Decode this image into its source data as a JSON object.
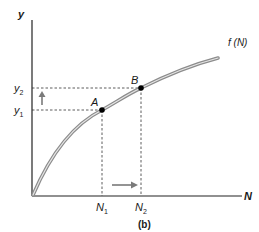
{
  "diagram": {
    "caption": "(b)",
    "axes": {
      "y_label": "y",
      "x_label": "N"
    },
    "curve": {
      "label": "f (N)",
      "color": "#9a9a9a"
    },
    "points": [
      {
        "name": "A",
        "label": "A"
      },
      {
        "name": "B",
        "label": "B"
      }
    ],
    "y_ticks": [
      {
        "base": "y",
        "sub": "2"
      },
      {
        "base": "y",
        "sub": "1"
      }
    ],
    "x_ticks": [
      {
        "base": "N",
        "sub": "1"
      },
      {
        "base": "N",
        "sub": "2"
      }
    ],
    "arrows": {
      "vertical": "up-arrow",
      "horizontal": "right-arrow",
      "color": "#7a7a7a"
    }
  }
}
